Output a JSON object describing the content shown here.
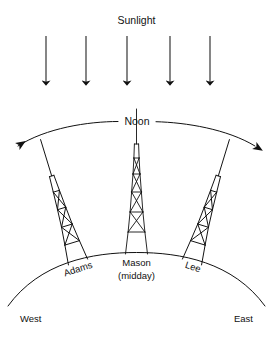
{
  "figure": {
    "title_label": "Sunlight",
    "arc_label": "Noon",
    "compass": {
      "west": "West",
      "east": "East"
    },
    "sites": [
      {
        "id": "adams",
        "label": "Adams",
        "sublabel": "",
        "tilt_deg": -17,
        "base_x": 78,
        "base_y": 262
      },
      {
        "id": "mason",
        "label": "Mason",
        "sublabel": "(midday)",
        "tilt_deg": 0,
        "base_x": 136,
        "base_y": 254
      },
      {
        "id": "lee",
        "label": "Lee",
        "sublabel": "",
        "tilt_deg": 17,
        "base_x": 192,
        "base_y": 262
      }
    ],
    "sun_rays": {
      "count": 5,
      "direction": "downward",
      "x_positions": [
        46,
        86,
        127,
        170,
        210
      ],
      "y_top": 36,
      "y_bottom": 86
    },
    "ground": {
      "left_x": 8,
      "right_x": 265,
      "apex_y": 253,
      "edge_y": 305
    },
    "noon_arc": {
      "left_x": 14,
      "right_x": 259,
      "apex_y": 122,
      "end_y": 148,
      "double_headed": true
    },
    "tower": {
      "sections": 4,
      "bracing": "x-brace",
      "has_mast": true
    },
    "colors": {
      "ink": "#111111",
      "ray": "#222222",
      "background": "#ffffff"
    }
  }
}
